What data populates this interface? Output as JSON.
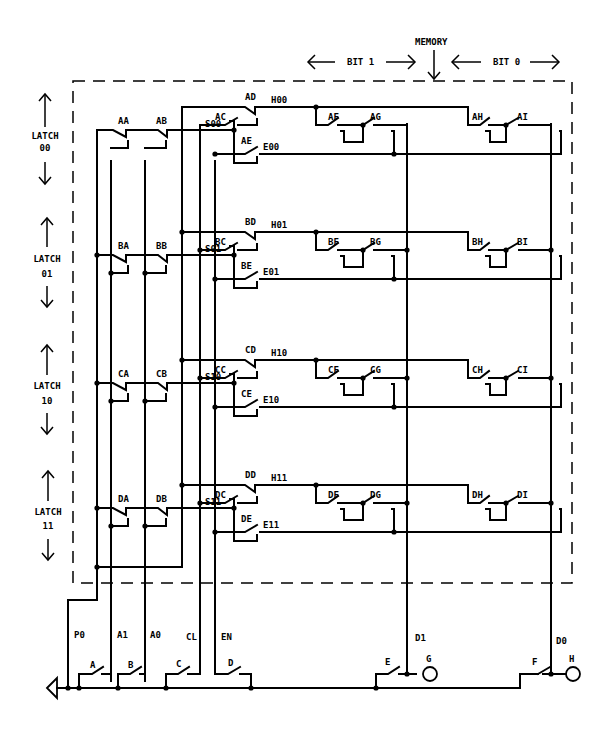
{
  "header": {
    "memory_label": "MEMORY",
    "bit1_label": "BIT 1",
    "bit0_label": "BIT 0"
  },
  "latches": [
    {
      "label": "LATCH",
      "index": "00",
      "row": "A",
      "h_net": "H00",
      "e_net": "E00",
      "s_net": "S00",
      "switches": [
        "AA",
        "AB",
        "AC",
        "AD",
        "AE",
        "AF",
        "AG",
        "AH",
        "AI"
      ]
    },
    {
      "label": "LATCH",
      "index": "01",
      "row": "B",
      "h_net": "H01",
      "e_net": "E01",
      "s_net": "S01",
      "switches": [
        "BA",
        "BB",
        "BC",
        "BD",
        "BE",
        "BF",
        "BG",
        "BH",
        "BI"
      ]
    },
    {
      "label": "LATCH",
      "index": "10",
      "row": "C",
      "h_net": "H10",
      "e_net": "E10",
      "s_net": "S10",
      "switches": [
        "CA",
        "CB",
        "CC",
        "CD",
        "CE",
        "CF",
        "CG",
        "CH",
        "CI"
      ]
    },
    {
      "label": "LATCH",
      "index": "11",
      "row": "D",
      "h_net": "H11",
      "e_net": "E11",
      "s_net": "S11",
      "switches": [
        "DA",
        "DB",
        "DC",
        "DD",
        "DE",
        "DF",
        "DG",
        "DH",
        "DI"
      ]
    }
  ],
  "inputs": {
    "lines": [
      "P0",
      "A1",
      "A0",
      "CL",
      "EN"
    ],
    "switches": [
      "A",
      "B",
      "C",
      "D"
    ]
  },
  "outputs": {
    "lines": [
      "D1",
      "D0"
    ],
    "switches": [
      "E",
      "F"
    ],
    "lamps": [
      "G",
      "H"
    ]
  }
}
